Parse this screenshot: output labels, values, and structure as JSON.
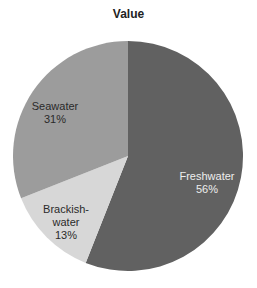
{
  "chart_data": {
    "type": "pie",
    "title": "Value",
    "categories": [
      "Freshwater",
      "Brackishwater",
      "Seawater"
    ],
    "values": [
      56,
      13,
      31
    ],
    "labels": [
      {
        "line1": "Freshwater",
        "line2": "",
        "pct": "56%"
      },
      {
        "line1": "Brackish-",
        "line2": "water",
        "pct": "13%"
      },
      {
        "line1": "Seawater",
        "line2": "",
        "pct": "31%"
      }
    ],
    "colors": [
      "#616161",
      "#d7d7d7",
      "#9c9c9c"
    ],
    "label_colors": [
      "#eeeeee",
      "#2a2a2a",
      "#2a2a2a"
    ],
    "start_angle_deg": 0,
    "direction": "clockwise",
    "legend": "none"
  }
}
